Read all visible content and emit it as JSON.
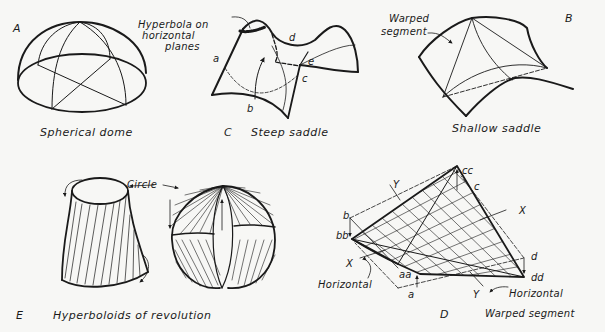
{
  "panels": {
    "A": {
      "letter": "A",
      "caption": "Spherical dome"
    },
    "C": {
      "letter": "C",
      "caption": "Steep saddle",
      "annotation_line1": "Hyperbola on",
      "annotation_line2": "horizontal",
      "annotation_line3": "planes",
      "points": {
        "a": "a",
        "b": "b",
        "c": "c",
        "d": "d",
        "e": "e"
      }
    },
    "B": {
      "letter": "B",
      "caption": "Shallow saddle",
      "annotation_line1": "Warped",
      "annotation_line2": "segment"
    },
    "E": {
      "letter": "E",
      "caption": "Hyperboloids of revolution",
      "annotation": "Circle"
    },
    "D": {
      "letter": "D",
      "caption": "Warped segment",
      "horizontal_left": "Horizontal",
      "horizontal_right": "Horizontal",
      "points": {
        "b": "b",
        "bb": "bb",
        "aa": "aa",
        "a": "a",
        "cc": "cc",
        "c": "c",
        "d": "d",
        "dd": "dd"
      },
      "axes": {
        "y_top": "Y",
        "x_right": "X",
        "x_left": "X",
        "y_bottom": "Y"
      }
    }
  },
  "colors": {
    "ink": "#1a1a1a",
    "paper": "#f7f7f5"
  }
}
